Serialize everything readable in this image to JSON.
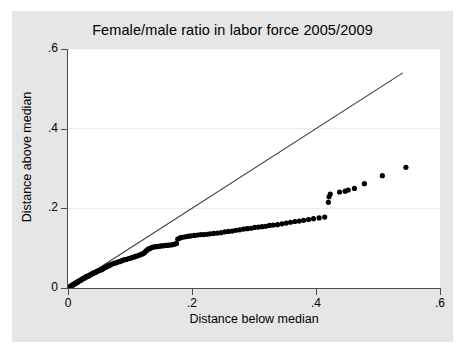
{
  "chart_data": {
    "type": "scatter",
    "title": "Female/male ratio in labor force 2005/2009",
    "xlabel": "Distance below median",
    "ylabel": "Distance above median",
    "xlim": [
      0,
      0.6
    ],
    "ylim": [
      0,
      0.6
    ],
    "xticks": [
      0,
      0.2,
      0.4,
      0.6
    ],
    "xticklabels": [
      "0",
      ".2",
      ".4",
      ".6"
    ],
    "yticks": [
      0,
      0.2,
      0.4,
      0.6
    ],
    "yticklabels": [
      "0",
      ".2",
      ".4",
      ".6"
    ],
    "grid": "horizontal",
    "legend": "none",
    "marker_color": "#000000",
    "line_color": "#3c3c3c",
    "plot_background": "#ffffff",
    "figure_background": "#e6e6e6",
    "reference_line": {
      "name": "45-degree reference line",
      "x": [
        0.0,
        0.54
      ],
      "y": [
        0.0,
        0.54
      ]
    },
    "series": [
      {
        "name": "Distance above median vs distance below median",
        "points": [
          [
            0.002,
            0.002
          ],
          [
            0.004,
            0.003
          ],
          [
            0.005,
            0.006
          ],
          [
            0.007,
            0.006
          ],
          [
            0.008,
            0.008
          ],
          [
            0.009,
            0.01
          ],
          [
            0.011,
            0.01
          ],
          [
            0.012,
            0.012
          ],
          [
            0.013,
            0.013
          ],
          [
            0.015,
            0.014
          ],
          [
            0.016,
            0.016
          ],
          [
            0.017,
            0.017
          ],
          [
            0.018,
            0.018
          ],
          [
            0.02,
            0.019
          ],
          [
            0.021,
            0.02
          ],
          [
            0.022,
            0.022
          ],
          [
            0.024,
            0.023
          ],
          [
            0.025,
            0.024
          ],
          [
            0.026,
            0.025
          ],
          [
            0.028,
            0.026
          ],
          [
            0.029,
            0.028
          ],
          [
            0.03,
            0.029
          ],
          [
            0.032,
            0.03
          ],
          [
            0.033,
            0.03
          ],
          [
            0.034,
            0.031
          ],
          [
            0.036,
            0.033
          ],
          [
            0.037,
            0.034
          ],
          [
            0.038,
            0.035
          ],
          [
            0.04,
            0.036
          ],
          [
            0.041,
            0.038
          ],
          [
            0.043,
            0.038
          ],
          [
            0.044,
            0.039
          ],
          [
            0.046,
            0.041
          ],
          [
            0.047,
            0.042
          ],
          [
            0.049,
            0.043
          ],
          [
            0.05,
            0.044
          ],
          [
            0.052,
            0.045
          ],
          [
            0.054,
            0.046
          ],
          [
            0.056,
            0.048
          ],
          [
            0.058,
            0.05
          ],
          [
            0.06,
            0.052
          ],
          [
            0.062,
            0.053
          ],
          [
            0.064,
            0.055
          ],
          [
            0.066,
            0.056
          ],
          [
            0.068,
            0.058
          ],
          [
            0.071,
            0.06
          ],
          [
            0.074,
            0.062
          ],
          [
            0.077,
            0.063
          ],
          [
            0.08,
            0.065
          ],
          [
            0.083,
            0.066
          ],
          [
            0.086,
            0.068
          ],
          [
            0.089,
            0.07
          ],
          [
            0.092,
            0.071
          ],
          [
            0.095,
            0.072
          ],
          [
            0.098,
            0.074
          ],
          [
            0.101,
            0.075
          ],
          [
            0.104,
            0.077
          ],
          [
            0.107,
            0.078
          ],
          [
            0.11,
            0.08
          ],
          [
            0.113,
            0.081
          ],
          [
            0.116,
            0.083
          ],
          [
            0.119,
            0.085
          ],
          [
            0.122,
            0.087
          ],
          [
            0.124,
            0.09
          ],
          [
            0.126,
            0.093
          ],
          [
            0.128,
            0.096
          ],
          [
            0.13,
            0.098
          ],
          [
            0.132,
            0.099
          ],
          [
            0.134,
            0.101
          ],
          [
            0.136,
            0.102
          ],
          [
            0.139,
            0.103
          ],
          [
            0.142,
            0.104
          ],
          [
            0.145,
            0.104
          ],
          [
            0.148,
            0.105
          ],
          [
            0.151,
            0.106
          ],
          [
            0.154,
            0.106
          ],
          [
            0.157,
            0.107
          ],
          [
            0.16,
            0.107
          ],
          [
            0.163,
            0.108
          ],
          [
            0.166,
            0.108
          ],
          [
            0.169,
            0.109
          ],
          [
            0.172,
            0.11
          ],
          [
            0.175,
            0.112
          ],
          [
            0.177,
            0.123
          ],
          [
            0.18,
            0.125
          ],
          [
            0.183,
            0.127
          ],
          [
            0.187,
            0.128
          ],
          [
            0.191,
            0.129
          ],
          [
            0.195,
            0.13
          ],
          [
            0.199,
            0.131
          ],
          [
            0.204,
            0.132
          ],
          [
            0.209,
            0.133
          ],
          [
            0.214,
            0.134
          ],
          [
            0.219,
            0.134
          ],
          [
            0.224,
            0.135
          ],
          [
            0.229,
            0.136
          ],
          [
            0.235,
            0.137
          ],
          [
            0.241,
            0.138
          ],
          [
            0.247,
            0.139
          ],
          [
            0.253,
            0.141
          ],
          [
            0.259,
            0.142
          ],
          [
            0.265,
            0.143
          ],
          [
            0.271,
            0.145
          ],
          [
            0.277,
            0.146
          ],
          [
            0.283,
            0.148
          ],
          [
            0.289,
            0.149
          ],
          [
            0.295,
            0.15
          ],
          [
            0.301,
            0.152
          ],
          [
            0.307,
            0.153
          ],
          [
            0.313,
            0.154
          ],
          [
            0.319,
            0.155
          ],
          [
            0.325,
            0.157
          ],
          [
            0.331,
            0.158
          ],
          [
            0.338,
            0.159
          ],
          [
            0.345,
            0.161
          ],
          [
            0.352,
            0.163
          ],
          [
            0.359,
            0.165
          ],
          [
            0.366,
            0.167
          ],
          [
            0.373,
            0.168
          ],
          [
            0.38,
            0.17
          ],
          [
            0.388,
            0.172
          ],
          [
            0.396,
            0.174
          ],
          [
            0.405,
            0.176
          ],
          [
            0.414,
            0.178
          ],
          [
            0.42,
            0.215
          ],
          [
            0.421,
            0.229
          ],
          [
            0.423,
            0.236
          ],
          [
            0.438,
            0.241
          ],
          [
            0.447,
            0.243
          ],
          [
            0.452,
            0.246
          ],
          [
            0.462,
            0.25
          ],
          [
            0.478,
            0.262
          ],
          [
            0.507,
            0.282
          ],
          [
            0.545,
            0.303
          ]
        ]
      }
    ]
  }
}
